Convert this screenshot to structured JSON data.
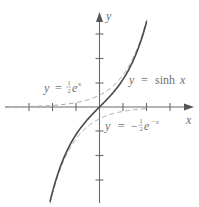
{
  "chart_data": {
    "type": "line",
    "title": "",
    "xlabel": "x",
    "ylabel": "y",
    "xlim": [
      -4,
      4
    ],
    "ylim": [
      -4,
      4
    ],
    "grid": false,
    "x_ticks": [
      -3,
      -2,
      -1,
      1,
      2,
      3
    ],
    "y_ticks": [
      -3,
      -2,
      -1,
      1,
      2,
      3
    ],
    "tick_labels_shown": false,
    "series": [
      {
        "name": "y = sinh x",
        "style": "solid",
        "formula": "sinh(x)",
        "x_range": [
          -2.1,
          2.0
        ]
      },
      {
        "name": "y = ½e^x",
        "style": "dashed",
        "formula": "0.5*exp(x)",
        "x_range": [
          -4,
          2.0
        ]
      },
      {
        "name": "y = −½e^−x",
        "style": "dashed",
        "formula": "-0.5*exp(-x)",
        "x_range": [
          -2.1,
          2.0
        ]
      }
    ],
    "annotations": [
      {
        "text": "y = ½e^x",
        "near": [
          -1.5,
          1.3
        ]
      },
      {
        "text": "y = sinh x",
        "near": [
          2.0,
          1.3
        ]
      },
      {
        "text": "y = −½e^−x",
        "near": [
          1.2,
          -1.2
        ]
      }
    ]
  },
  "labels": {
    "x_axis": "x",
    "y_axis": "y",
    "sinh": {
      "y": "y",
      "eq": "=",
      "fn": "sinh",
      "x": "x"
    },
    "half_ex": {
      "y": "y",
      "eq": "=",
      "num": "1",
      "den": "2",
      "e": "e",
      "exp": "x"
    },
    "neg_half_emx": {
      "y": "y",
      "eq": "=",
      "minus": "−",
      "num": "1",
      "den": "2",
      "e": "e",
      "exp": "−x"
    }
  }
}
